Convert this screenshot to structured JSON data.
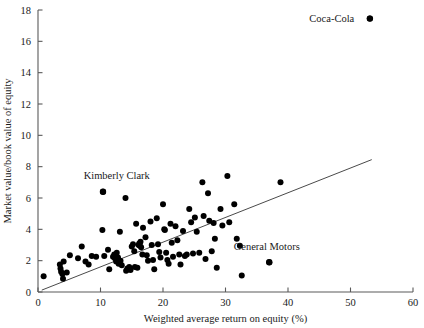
{
  "chart_data": {
    "type": "scatter",
    "title": "",
    "xlabel": "Weighted average return on equity (%)",
    "ylabel": "Market value/book value of equity",
    "xlim": [
      0,
      60
    ],
    "ylim": [
      0,
      18
    ],
    "xticks": [
      0,
      10,
      20,
      30,
      40,
      50,
      60
    ],
    "yticks": [
      0,
      2,
      4,
      6,
      8,
      10,
      12,
      14,
      16,
      18
    ],
    "grid": false,
    "legend": "none",
    "trendline": {
      "label": "regression line",
      "x_start": 0.6,
      "y_start": 0.12,
      "x_end": 53.4,
      "y_end": 8.45
    },
    "annotations": [
      {
        "label": "Coca-Cola",
        "x": 53.1,
        "y": 17.45,
        "text_anchor": "end",
        "text_x": 50.6,
        "text_y": 17.45
      },
      {
        "label": "Kimberly Clark",
        "x": 10.4,
        "y": 6.4,
        "text_anchor": "middle",
        "text_x": 12.6,
        "text_y": 7.45
      },
      {
        "label": "General Motors",
        "x": 37.0,
        "y": 1.9,
        "text_anchor": "middle",
        "text_x": 36.6,
        "text_y": 2.9
      }
    ],
    "points": [
      [
        0.9,
        1.0
      ],
      [
        3.5,
        1.75
      ],
      [
        3.6,
        1.5
      ],
      [
        3.7,
        1.3
      ],
      [
        3.9,
        1.15
      ],
      [
        4.0,
        0.85
      ],
      [
        4.1,
        1.95
      ],
      [
        4.6,
        1.25
      ],
      [
        5.1,
        2.35
      ],
      [
        6.4,
        2.15
      ],
      [
        7.0,
        2.9
      ],
      [
        7.6,
        1.95
      ],
      [
        8.1,
        1.75
      ],
      [
        8.6,
        2.3
      ],
      [
        9.3,
        2.25
      ],
      [
        10.4,
        6.4
      ],
      [
        10.3,
        3.95
      ],
      [
        10.6,
        2.3
      ],
      [
        11.2,
        2.7
      ],
      [
        11.4,
        1.45
      ],
      [
        12.0,
        2.25
      ],
      [
        12.2,
        2.4
      ],
      [
        12.3,
        2.15
      ],
      [
        12.4,
        2.3
      ],
      [
        12.5,
        1.95
      ],
      [
        12.6,
        2.5
      ],
      [
        12.8,
        2.2
      ],
      [
        12.9,
        1.8
      ],
      [
        13.1,
        3.85
      ],
      [
        13.2,
        2.0
      ],
      [
        13.4,
        1.7
      ],
      [
        14.0,
        6.0
      ],
      [
        14.1,
        1.35
      ],
      [
        14.3,
        1.5
      ],
      [
        14.5,
        1.45
      ],
      [
        14.6,
        1.6
      ],
      [
        14.8,
        1.4
      ],
      [
        15.0,
        2.9
      ],
      [
        15.2,
        3.05
      ],
      [
        15.4,
        2.6
      ],
      [
        15.5,
        1.6
      ],
      [
        15.7,
        4.35
      ],
      [
        15.9,
        1.55
      ],
      [
        16.1,
        3.0
      ],
      [
        16.2,
        3.1
      ],
      [
        16.3,
        2.95
      ],
      [
        16.4,
        3.2
      ],
      [
        16.5,
        2.85
      ],
      [
        16.7,
        2.4
      ],
      [
        16.8,
        4.1
      ],
      [
        17.2,
        3.5
      ],
      [
        17.4,
        2.35
      ],
      [
        17.6,
        2.0
      ],
      [
        18.0,
        4.5
      ],
      [
        18.2,
        3.0
      ],
      [
        18.4,
        2.05
      ],
      [
        18.6,
        1.45
      ],
      [
        19.0,
        4.7
      ],
      [
        19.2,
        3.05
      ],
      [
        19.4,
        2.55
      ],
      [
        19.6,
        2.2
      ],
      [
        20.0,
        5.6
      ],
      [
        20.2,
        4.0
      ],
      [
        20.3,
        3.95
      ],
      [
        20.5,
        2.5
      ],
      [
        20.7,
        2.05
      ],
      [
        20.9,
        1.8
      ],
      [
        21.2,
        4.35
      ],
      [
        21.4,
        3.15
      ],
      [
        21.6,
        2.25
      ],
      [
        22.0,
        4.2
      ],
      [
        22.3,
        3.3
      ],
      [
        22.6,
        2.4
      ],
      [
        22.8,
        1.75
      ],
      [
        23.2,
        3.9
      ],
      [
        23.5,
        2.3
      ],
      [
        23.8,
        2.4
      ],
      [
        24.2,
        5.3
      ],
      [
        24.5,
        4.45
      ],
      [
        24.8,
        2.45
      ],
      [
        25.1,
        4.75
      ],
      [
        25.4,
        3.85
      ],
      [
        25.8,
        2.5
      ],
      [
        26.3,
        7.0
      ],
      [
        26.5,
        4.85
      ],
      [
        26.8,
        2.1
      ],
      [
        27.2,
        6.3
      ],
      [
        27.4,
        4.55
      ],
      [
        27.8,
        2.6
      ],
      [
        28.1,
        4.4
      ],
      [
        28.3,
        3.4
      ],
      [
        28.6,
        1.55
      ],
      [
        29.2,
        5.3
      ],
      [
        29.5,
        4.25
      ],
      [
        30.3,
        7.4
      ],
      [
        30.6,
        4.45
      ],
      [
        31.4,
        5.6
      ],
      [
        31.8,
        3.4
      ],
      [
        32.3,
        2.95
      ],
      [
        32.6,
        1.05
      ],
      [
        38.8,
        7.0
      ],
      [
        37.0,
        1.9
      ],
      [
        53.1,
        17.45
      ]
    ]
  },
  "axis": {
    "x_label": "Weighted average return on equity (%)",
    "y_label": "Market value/book value of equity",
    "x_tick_labels": [
      "0",
      "10",
      "20",
      "30",
      "40",
      "50",
      "60"
    ],
    "y_tick_labels": [
      "0",
      "2",
      "4",
      "6",
      "8",
      "10",
      "12",
      "14",
      "16",
      "18"
    ]
  },
  "colors": {
    "point": "#000000",
    "axis": "#5a5a5a",
    "trendline": "#4a4a4a",
    "background": "#ffffff",
    "text": "#1a1a1a"
  }
}
